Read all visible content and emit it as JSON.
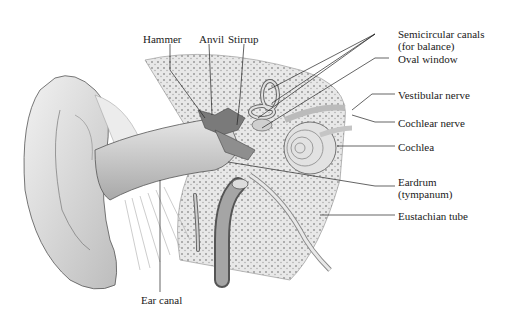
{
  "diagram": {
    "labels": {
      "hammer": "Hammer",
      "anvil": "Anvil",
      "stirrup": "Stirrup",
      "semicircular_line1": "Semicircular canals",
      "semicircular_line2": "(for balance)",
      "oval_window": "Oval window",
      "vestibular_nerve": "Vestibular nerve",
      "cochlear_nerve": "Cochlear nerve",
      "cochlea": "Cochlea",
      "eardrum_line1": "Eardrum",
      "eardrum_line2": "(tympanum)",
      "eustachian_tube": "Eustachian tube",
      "ear_canal": "Ear canal"
    },
    "colors": {
      "background": "#ffffff",
      "ink": "#1a1a1a",
      "shade": "#b5b5b5",
      "bone": "#d9d9d9"
    }
  }
}
